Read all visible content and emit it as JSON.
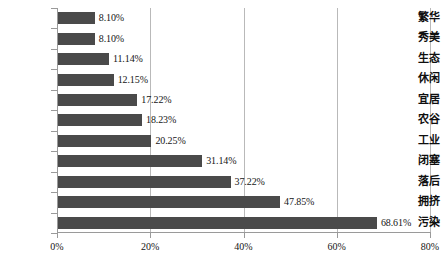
{
  "chart_data": {
    "type": "bar",
    "orientation": "horizontal",
    "title": "",
    "subtitle": "",
    "xlabel": "",
    "ylabel": "",
    "grid": true,
    "legend": false,
    "legend_position": "none",
    "xlim": [
      0,
      80
    ],
    "categories": [
      "繁华",
      "秀美",
      "生态",
      "休闲",
      "宜居",
      "农谷",
      "工业",
      "闭塞",
      "落后",
      "拥挤",
      "污染"
    ],
    "values": [
      8.1,
      8.1,
      11.14,
      12.15,
      17.22,
      18.23,
      20.25,
      31.14,
      37.22,
      47.85,
      68.61
    ],
    "value_labels": [
      "8.10%",
      "8.10%",
      "11.14%",
      "12.15%",
      "17.22%",
      "18.23%",
      "20.25%",
      "31.14%",
      "37.22%",
      "47.85%",
      "68.61%"
    ],
    "xticks": [
      0,
      20,
      40,
      60,
      80
    ],
    "xtick_labels": [
      "0%",
      "20%",
      "40%",
      "60%",
      "80%"
    ],
    "colors": {
      "bar": "#4a4a4a",
      "gridline": "#b9b9b9",
      "axis": "#9a9a9a",
      "background": "#ffffff",
      "text": "#151515"
    }
  }
}
